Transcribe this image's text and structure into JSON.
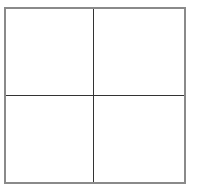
{
  "diagram": {
    "type": "2x2 grid",
    "rows": 2,
    "columns": 2,
    "cells": [
      {
        "label": ""
      },
      {
        "label": ""
      },
      {
        "label": ""
      },
      {
        "label": ""
      }
    ],
    "colors": {
      "border": "#8a8a8a",
      "divider": "#333333",
      "background": "#ffffff"
    }
  }
}
